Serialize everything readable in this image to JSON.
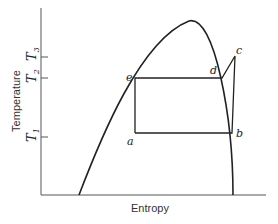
{
  "diagram": {
    "type": "T-s diagram (vapor dome with Rankine cycle)",
    "axes": {
      "x_label": "Entropy",
      "y_label": "Temperature"
    },
    "temperature_ticks": [
      {
        "base": "T",
        "sub": "3"
      },
      {
        "base": "T",
        "sub": "2"
      },
      {
        "base": "T",
        "sub": "1"
      }
    ],
    "points": {
      "a": "a",
      "b": "b",
      "c": "c",
      "d": "d",
      "e": "e"
    },
    "cycle_path": [
      "a",
      "e",
      "d",
      "c",
      "b",
      "a"
    ]
  }
}
